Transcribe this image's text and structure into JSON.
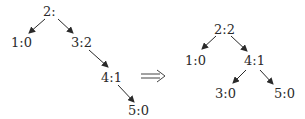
{
  "diagram": {
    "transform_arrow": "⟹",
    "before": {
      "nodes": [
        {
          "id": "b2",
          "label": "2:",
          "x": 50,
          "y": 12
        },
        {
          "id": "b1",
          "label": "1:0",
          "x": 12,
          "y": 42
        },
        {
          "id": "b3",
          "label": "3:2",
          "x": 80,
          "y": 42
        },
        {
          "id": "b4",
          "label": "4:1",
          "x": 107,
          "y": 77
        },
        {
          "id": "b5",
          "label": "5:0",
          "x": 132,
          "y": 112
        }
      ],
      "edges": [
        [
          "b2",
          "b1"
        ],
        [
          "b2",
          "b3"
        ],
        [
          "b3",
          "b4"
        ],
        [
          "b4",
          "b5"
        ]
      ]
    },
    "after": {
      "nodes": [
        {
          "id": "a2",
          "label": "2:2",
          "x": 224,
          "y": 30
        },
        {
          "id": "a1",
          "label": "1:0",
          "x": 194,
          "y": 61
        },
        {
          "id": "a4",
          "label": "4:1",
          "x": 252,
          "y": 61
        },
        {
          "id": "a3",
          "label": "3:0",
          "x": 222,
          "y": 94
        },
        {
          "id": "a5",
          "label": "5:0",
          "x": 283,
          "y": 94
        }
      ],
      "edges": [
        [
          "a2",
          "a1"
        ],
        [
          "a2",
          "a4"
        ],
        [
          "a4",
          "a3"
        ],
        [
          "a4",
          "a5"
        ]
      ]
    }
  }
}
